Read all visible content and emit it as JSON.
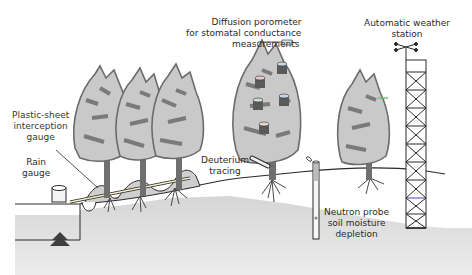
{
  "figure": {
    "colors": {
      "canopy_light": "#c9c9c9",
      "canopy_dark": "#7a7a7a",
      "trunk": "#6f6f6f",
      "ground": "#dcdcdc",
      "ground_line": "#2a2a2a",
      "text": "#2c2a28"
    },
    "labels": {
      "porometer": [
        "Diffusion porometer",
        "for stomatal conductance",
        "measurements"
      ],
      "weather_station": [
        "Automatic weather",
        "station"
      ],
      "plastic_sheet": [
        "Plastic-sheet",
        "interception",
        "gauge"
      ],
      "rain_gauge": [
        "Rain",
        "gauge"
      ],
      "deuterium": [
        "Deuterium",
        "tracing"
      ],
      "neutron_probe": [
        "Neutron probe",
        "soil moisture",
        "depletion"
      ]
    },
    "icons": [
      "tree-icon",
      "rain-gauge-icon",
      "plastic-sheet-gauge-icon",
      "deuterium-tube-icon",
      "porometer-cup-icon",
      "neutron-probe-icon",
      "weather-station-tower-icon",
      "anemometer-icon"
    ]
  }
}
